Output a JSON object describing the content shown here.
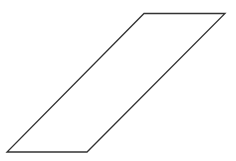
{
  "diagram": {
    "shape": "parallelogram",
    "stroke_color": "#333333",
    "fill_color": "#ffffff",
    "vertices": [
      {
        "x": 144,
        "y": 13.5
      },
      {
        "x": 225,
        "y": 13.5
      },
      {
        "x": 87,
        "y": 152
      },
      {
        "x": 7,
        "y": 152
      }
    ]
  }
}
